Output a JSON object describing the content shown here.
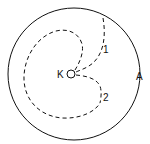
{
  "diagram": {
    "type": "trajectory-schematic",
    "colors": {
      "stroke": "#111111",
      "background": "#ffffff"
    },
    "outer_circle": {
      "label": "A",
      "cx": 74,
      "cy": 74,
      "r": 66
    },
    "center_point": {
      "label": "K",
      "cx": 72,
      "cy": 73,
      "r": 4
    },
    "paths": [
      {
        "label": "1",
        "style": "dashed",
        "description": "from outer circle A inward to K"
      },
      {
        "label": "2",
        "style": "dashed",
        "description": "from K outward, continuing as large loop back around"
      }
    ],
    "labels": {
      "A": "A",
      "K": "K",
      "path1": "1",
      "path2": "2"
    }
  }
}
